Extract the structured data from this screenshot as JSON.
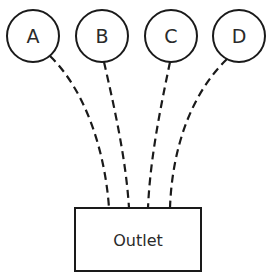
{
  "diagram": {
    "nodes": [
      {
        "id": "A",
        "label": "A",
        "cx": 33,
        "cy": 36,
        "r": 26
      },
      {
        "id": "B",
        "label": "B",
        "cx": 102,
        "cy": 36,
        "r": 26
      },
      {
        "id": "C",
        "label": "C",
        "cx": 171,
        "cy": 36,
        "r": 26
      },
      {
        "id": "D",
        "label": "D",
        "cx": 239,
        "cy": 36,
        "r": 26
      }
    ],
    "outlet": {
      "label": "Outlet",
      "x": 75,
      "y": 208,
      "width": 126,
      "height": 63
    },
    "connections": [
      {
        "from": "A",
        "to": "Outlet",
        "style": "dashed"
      },
      {
        "from": "B",
        "to": "Outlet",
        "style": "dashed"
      },
      {
        "from": "C",
        "to": "Outlet",
        "style": "dashed"
      },
      {
        "from": "D",
        "to": "Outlet",
        "style": "dashed"
      }
    ],
    "colors": {
      "stroke": "#1a1a1a",
      "background": "#ffffff"
    }
  }
}
